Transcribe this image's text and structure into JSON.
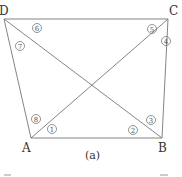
{
  "diagram": {
    "caption": "(a)",
    "vertices": {
      "A": {
        "label": "A",
        "x": 31,
        "y": 138
      },
      "B": {
        "label": "B",
        "x": 162,
        "y": 138
      },
      "C": {
        "label": "C",
        "x": 168,
        "y": 19
      },
      "D": {
        "label": "D",
        "x": 4,
        "y": 19
      }
    },
    "edges": [
      "AB",
      "BC",
      "CD",
      "DA",
      "AC",
      "BD"
    ],
    "angle_labels": [
      {
        "id": "1",
        "text": "1",
        "x": 52,
        "y": 129
      },
      {
        "id": "2",
        "text": "2",
        "x": 133,
        "y": 130
      },
      {
        "id": "3",
        "text": "3",
        "x": 151,
        "y": 120
      },
      {
        "id": "4",
        "text": "4",
        "x": 166,
        "y": 41
      },
      {
        "id": "5",
        "text": "5",
        "x": 152,
        "y": 29
      },
      {
        "id": "6",
        "text": "6",
        "x": 37,
        "y": 28
      },
      {
        "id": "7",
        "text": "7",
        "x": 20,
        "y": 46
      },
      {
        "id": "8",
        "text": "8",
        "x": 36,
        "y": 119
      }
    ],
    "colors": {
      "line": "#777777",
      "text": "#333333"
    }
  }
}
